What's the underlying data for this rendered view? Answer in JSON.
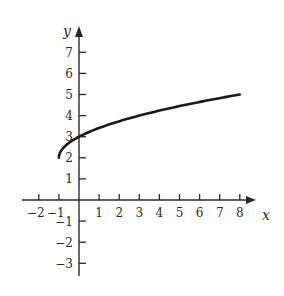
{
  "chart_data": {
    "type": "line",
    "title": "",
    "xlabel": "x",
    "ylabel": "y",
    "xlim": [
      -2.5,
      9
    ],
    "ylim": [
      -3.5,
      8
    ],
    "grid": false,
    "legend": null,
    "x_ticks": [
      -2,
      -1,
      1,
      2,
      3,
      4,
      5,
      6,
      7,
      8
    ],
    "x_tick_labels": [
      "−2",
      "−1",
      "1",
      "2",
      "3",
      "4",
      "5",
      "6",
      "7",
      "8"
    ],
    "y_ticks": [
      -3,
      -2,
      -1,
      1,
      2,
      3,
      4,
      5,
      6,
      7
    ],
    "y_tick_labels": [
      "−3",
      "−2",
      "−1",
      "1",
      "2",
      "3",
      "4",
      "5",
      "6",
      "7"
    ],
    "series": [
      {
        "name": "curve",
        "function": "y = sqrt(x + 1) + 2",
        "x": [
          -1,
          -0.75,
          0,
          1,
          2,
          3,
          4,
          5,
          6,
          7,
          8
        ],
        "y": [
          2,
          2.5,
          3,
          3.41,
          3.73,
          4,
          4.24,
          4.45,
          4.65,
          4.83,
          5
        ],
        "color": "#1a1a1a"
      }
    ]
  },
  "colors": {
    "axis": "#2a2a2a",
    "curve": "#1a1a1a",
    "background": "#ffffff"
  }
}
